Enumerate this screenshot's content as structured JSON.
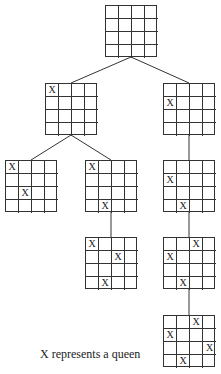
{
  "caption": "X represents a queen",
  "queen_symbol": "X",
  "boards": [
    {
      "id": "root",
      "x": 105,
      "y": 5,
      "queens": []
    },
    {
      "id": "l1-left",
      "x": 45,
      "y": 83,
      "queens": [
        [
          0,
          0
        ]
      ]
    },
    {
      "id": "l1-right",
      "x": 163,
      "y": 83,
      "queens": [
        [
          1,
          0
        ]
      ]
    },
    {
      "id": "l2-left",
      "x": 5,
      "y": 160,
      "queens": [
        [
          0,
          0
        ],
        [
          2,
          1
        ]
      ]
    },
    {
      "id": "l2-mid",
      "x": 85,
      "y": 160,
      "queens": [
        [
          0,
          0
        ],
        [
          3,
          1
        ]
      ]
    },
    {
      "id": "l2-right",
      "x": 163,
      "y": 160,
      "queens": [
        [
          1,
          0
        ],
        [
          3,
          1
        ]
      ]
    },
    {
      "id": "l3-mid",
      "x": 85,
      "y": 237,
      "queens": [
        [
          0,
          0
        ],
        [
          3,
          1
        ],
        [
          1,
          2
        ]
      ]
    },
    {
      "id": "l3-right",
      "x": 163,
      "y": 237,
      "queens": [
        [
          1,
          0
        ],
        [
          3,
          1
        ],
        [
          0,
          2
        ]
      ]
    },
    {
      "id": "l4-right",
      "x": 163,
      "y": 315,
      "queens": [
        [
          1,
          0
        ],
        [
          3,
          1
        ],
        [
          0,
          2
        ],
        [
          2,
          3
        ]
      ]
    }
  ],
  "edges": [
    [
      131,
      57,
      71,
      83
    ],
    [
      131,
      57,
      189,
      83
    ],
    [
      71,
      135,
      31,
      160
    ],
    [
      71,
      135,
      111,
      160
    ],
    [
      189,
      135,
      189,
      160
    ],
    [
      111,
      212,
      111,
      237
    ],
    [
      189,
      212,
      189,
      237
    ],
    [
      189,
      289,
      189,
      315
    ]
  ]
}
